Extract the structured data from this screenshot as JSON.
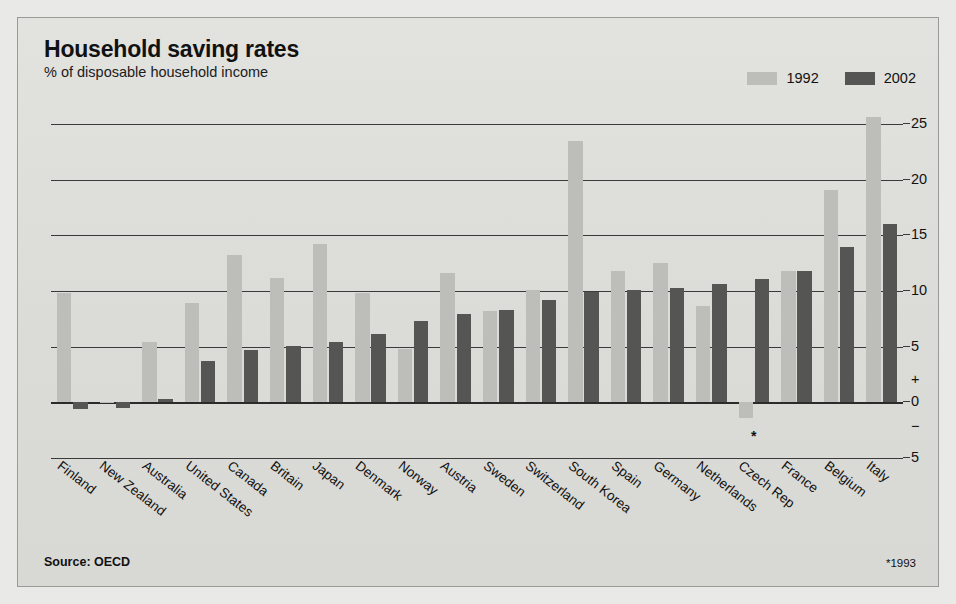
{
  "header": {
    "title": "Household saving rates",
    "subtitle": "% of disposable household income"
  },
  "legend": [
    {
      "label": "1992",
      "color": "#bdbdb9"
    },
    {
      "label": "2002",
      "color": "#555553"
    }
  ],
  "footer": {
    "source": "Source: OECD",
    "note": "*1993"
  },
  "axis": {
    "ticks": [
      "25",
      "20",
      "15",
      "10",
      "5",
      "+",
      "0",
      "−",
      "5"
    ]
  },
  "annotation": {
    "asterisk": "*"
  },
  "chart_data": {
    "type": "bar",
    "title": "Household saving rates",
    "subtitle": "% of disposable household income",
    "xlabel": "",
    "ylabel": "% of disposable household income",
    "ylim": [
      -5,
      26
    ],
    "grid": true,
    "gridlines": [
      25,
      20,
      15,
      10,
      5,
      0,
      -5
    ],
    "legend_position": "top-right",
    "categories": [
      "Finland",
      "New Zealand",
      "Australia",
      "United States",
      "Canada",
      "Britain",
      "Japan",
      "Denmark",
      "Norway",
      "Austria",
      "Sweden",
      "Switzerland",
      "South Korea",
      "Spain",
      "Germany",
      "Netherlands",
      "Czech Rep",
      "France",
      "Belgium",
      "Italy"
    ],
    "series": [
      {
        "name": "1992",
        "color": "#bdbdb9",
        "values": [
          9.8,
          0.0,
          5.4,
          8.9,
          13.2,
          11.2,
          14.2,
          9.8,
          4.8,
          11.6,
          8.2,
          10.1,
          23.5,
          11.8,
          12.5,
          8.7,
          -1.4,
          11.8,
          19.1,
          25.6
        ]
      },
      {
        "name": "2002",
        "color": "#555553",
        "values": [
          -0.6,
          -0.5,
          0.3,
          3.7,
          4.7,
          5.1,
          5.4,
          6.1,
          7.3,
          7.9,
          8.3,
          9.2,
          9.9,
          10.1,
          10.3,
          10.6,
          11.1,
          11.8,
          14.0,
          16.0
        ]
      }
    ],
    "annotations": [
      {
        "text": "*",
        "category": "Czech Rep",
        "meaning": "1993"
      }
    ]
  }
}
